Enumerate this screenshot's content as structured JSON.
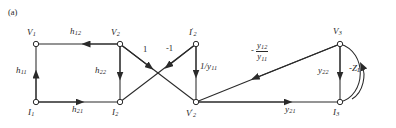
{
  "figure": {
    "tag": "(a)",
    "type": "signal-flow-graph",
    "stroke_color": "#2a2a2a",
    "node_fill": "#ffffff"
  },
  "nodes": [
    {
      "id": "V1",
      "label": "V",
      "sub": "1",
      "prime": "",
      "x": 36,
      "y": 44,
      "label_pos": "above-left"
    },
    {
      "id": "V2",
      "label": "V",
      "sub": "2",
      "prime": "",
      "x": 120,
      "y": 44,
      "label_pos": "above-left"
    },
    {
      "id": "I2p",
      "label": "I",
      "sub": "2",
      "prime": "'",
      "x": 196,
      "y": 44,
      "label_pos": "above"
    },
    {
      "id": "V3",
      "label": "V",
      "sub": "3",
      "prime": "",
      "x": 340,
      "y": 44,
      "label_pos": "above"
    },
    {
      "id": "I1",
      "label": "I",
      "sub": "1",
      "prime": "",
      "x": 36,
      "y": 102,
      "label_pos": "below-left"
    },
    {
      "id": "I2",
      "label": "I",
      "sub": "2",
      "prime": "",
      "x": 120,
      "y": 102,
      "label_pos": "below-left"
    },
    {
      "id": "V2p",
      "label": "V",
      "sub": "2",
      "prime": "'",
      "x": 196,
      "y": 102,
      "label_pos": "below-left"
    },
    {
      "id": "I3",
      "label": "I",
      "sub": "3",
      "prime": "",
      "x": 340,
      "y": 102,
      "label_pos": "below"
    }
  ],
  "edges": [
    {
      "id": "e-h12",
      "from": "V2",
      "to": "V1",
      "label": "h",
      "sub": "12",
      "kind": "plain"
    },
    {
      "id": "e-h11",
      "from": "I1",
      "to": "V1",
      "label": "h",
      "sub": "11",
      "kind": "plain"
    },
    {
      "id": "e-h22",
      "from": "V2",
      "to": "I2",
      "label": "h",
      "sub": "22",
      "kind": "plain"
    },
    {
      "id": "e-h21",
      "from": "I1",
      "to": "I2",
      "label": "h",
      "sub": "21",
      "kind": "plain"
    },
    {
      "id": "e-one",
      "from": "V2",
      "to": "V2p",
      "label": "1",
      "sub": "",
      "kind": "number"
    },
    {
      "id": "e-negone",
      "from": "I2p",
      "to": "I2",
      "label": "-1",
      "sub": "",
      "kind": "number"
    },
    {
      "id": "e-invy11",
      "from": "I2p",
      "to": "V2p",
      "label": "1/y",
      "sub": "11",
      "kind": "plain"
    },
    {
      "id": "e-y12y11",
      "from": "V2p",
      "to": "V3",
      "label": "fraction",
      "numerator": "y",
      "numerator_sub": "12",
      "denominator": "y",
      "denominator_sub": "11",
      "sign": "-",
      "kind": "fraction"
    },
    {
      "id": "e-y21",
      "from": "V2p",
      "to": "I3",
      "label": "y",
      "sub": "21",
      "kind": "plain"
    },
    {
      "id": "e-y22",
      "from": "V3",
      "to": "I3",
      "label": "y",
      "sub": "22",
      "kind": "plain"
    },
    {
      "id": "e-zl",
      "from": "I3",
      "to": "V3",
      "label": "-Z",
      "sub": "L",
      "kind": "curved"
    }
  ]
}
